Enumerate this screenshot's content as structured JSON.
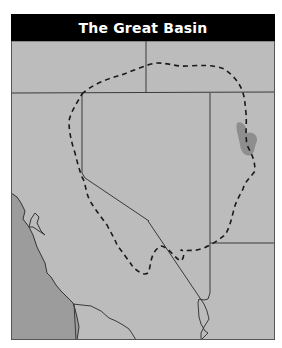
{
  "title": "The Great Basin",
  "map": {
    "subject": "Great Basin region of the western United States",
    "regions": [
      "Oregon",
      "Idaho",
      "California",
      "Nevada",
      "Utah",
      "Arizona",
      "Pacific Ocean"
    ],
    "features": [
      {
        "name": "great-basin-boundary",
        "style": "dashed",
        "color": "#1a1a1a"
      },
      {
        "name": "great-salt-lake",
        "color": "#8f8f8f"
      },
      {
        "name": "san-francisco-bay"
      },
      {
        "name": "pacific-ocean",
        "color": "#9a9a9a"
      }
    ],
    "colors": {
      "land": "#bcbcbc",
      "ocean": "#9c9c9c",
      "lake": "#8e8e8e",
      "border": "#3a3a3a",
      "title_bg": "#000000",
      "title_text": "#ffffff"
    }
  }
}
